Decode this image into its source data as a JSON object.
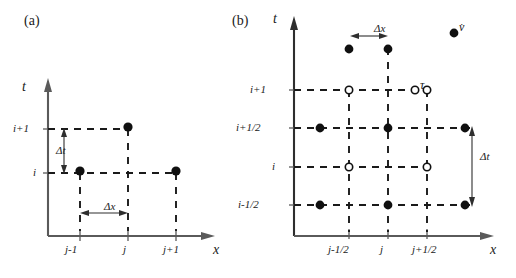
{
  "figure": {
    "background": "#ffffff",
    "ink": "#101010",
    "axis_color": "#5a5a5a"
  },
  "panels": [
    {
      "id": "a",
      "label": "(a)",
      "type": "regular-grid-stencil",
      "axes": {
        "x_label": "x",
        "y_label": "t",
        "x_ticks": [
          "j-1",
          "j",
          "j+1"
        ],
        "y_ticks": [
          "i+1",
          "i"
        ]
      },
      "annotations": [
        {
          "name": "delta-t",
          "text": "Δt",
          "orientation": "vertical"
        },
        {
          "name": "delta-x",
          "text": "Δx",
          "orientation": "horizontal"
        }
      ],
      "nodes": [
        {
          "x": "j",
          "y": "i+1",
          "marker": "filled"
        },
        {
          "x": "j-1",
          "y": "i",
          "marker": "filled"
        },
        {
          "x": "j+1",
          "y": "i",
          "marker": "filled"
        }
      ]
    },
    {
      "id": "b",
      "label": "(b)",
      "type": "staggered-grid-stencil",
      "axes": {
        "x_label": "x",
        "y_label": "t",
        "x_ticks": [
          "j-1/2",
          "j",
          "j+1/2"
        ],
        "y_ticks": [
          "i+1",
          "i+1/2",
          "i",
          "i-1/2"
        ]
      },
      "annotations": [
        {
          "name": "delta-x",
          "text": "Δx",
          "orientation": "horizontal"
        },
        {
          "name": "delta-t",
          "text": "Δt",
          "orientation": "vertical"
        }
      ],
      "legend": [
        {
          "name": "velocity",
          "marker": "filled",
          "text": "v̇"
        },
        {
          "name": "stress",
          "marker": "open",
          "text": "τ"
        }
      ],
      "nodes": [
        {
          "x": "j-1/2",
          "y": "i+1",
          "marker": "open"
        },
        {
          "x": "j+1/2",
          "y": "i+1",
          "marker": "open"
        },
        {
          "x": "j-1",
          "y": "i+1/2",
          "marker": "filled"
        },
        {
          "x": "j",
          "y": "i+1/2",
          "marker": "filled"
        },
        {
          "x": "j+1",
          "y": "i+1/2",
          "marker": "filled"
        },
        {
          "x": "j-1/2",
          "y": "i",
          "marker": "open"
        },
        {
          "x": "j+1/2",
          "y": "i",
          "marker": "open"
        },
        {
          "x": "j-1",
          "y": "i-1/2",
          "marker": "filled"
        },
        {
          "x": "j",
          "y": "i-1/2",
          "marker": "filled"
        },
        {
          "x": "j+1",
          "y": "i-1/2",
          "marker": "filled"
        },
        {
          "x": "j-1",
          "y": "top",
          "marker": "filled"
        },
        {
          "x": "j",
          "y": "top",
          "marker": "filled"
        }
      ]
    }
  ]
}
